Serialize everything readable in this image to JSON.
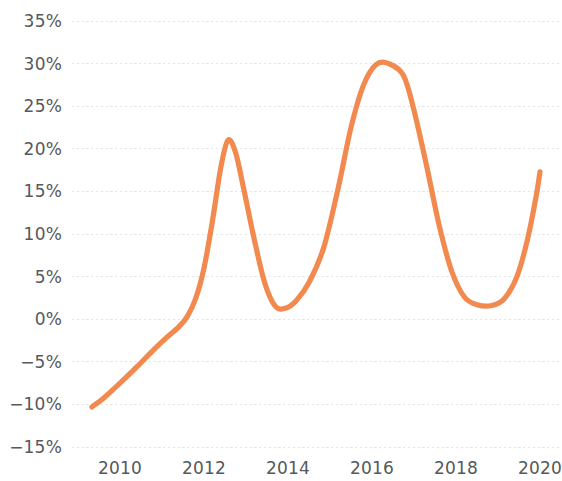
{
  "chart_data": {
    "type": "line",
    "title": "",
    "subtitle": "",
    "xlabel": "",
    "ylabel": "",
    "xlim": [
      2009.3,
      2020.0
    ],
    "ylim": [
      -15,
      35
    ],
    "grid": true,
    "legend_position": "none",
    "y_ticks": [
      "35%",
      "30%",
      "25%",
      "20%",
      "15%",
      "10%",
      "5%",
      "0%",
      "−5%",
      "−10%",
      "−15%"
    ],
    "y_tick_values": [
      35,
      30,
      25,
      20,
      15,
      10,
      5,
      0,
      -5,
      -10,
      -15
    ],
    "x_ticks": [
      "2010",
      "2012",
      "2014",
      "2016",
      "2018",
      "2020"
    ],
    "x_tick_values": [
      2010,
      2012,
      2014,
      2016,
      2018,
      2020
    ],
    "series": [
      {
        "name": "Series 1",
        "color": "#f2894f",
        "x": [
          2009.33,
          2009.6,
          2010.0,
          2010.4,
          2010.8,
          2011.1,
          2011.4,
          2011.6,
          2011.8,
          2012.0,
          2012.2,
          2012.4,
          2012.57,
          2012.75,
          2012.95,
          2013.2,
          2013.45,
          2013.7,
          2013.95,
          2014.2,
          2014.5,
          2014.85,
          2015.2,
          2015.5,
          2015.8,
          2016.1,
          2016.4,
          2016.75,
          2017.0,
          2017.3,
          2017.6,
          2017.9,
          2018.2,
          2018.5,
          2018.85,
          2019.15,
          2019.45,
          2019.7,
          2019.9,
          2020.0
        ],
        "y": [
          -10.3,
          -9.3,
          -7.5,
          -5.6,
          -3.6,
          -2.2,
          -0.9,
          0.3,
          2.4,
          6.0,
          11.5,
          17.8,
          21.0,
          19.6,
          15.2,
          9.3,
          4.2,
          1.5,
          1.3,
          2.2,
          4.3,
          8.4,
          15.5,
          22.5,
          27.5,
          29.9,
          30.0,
          28.6,
          24.5,
          18.0,
          11.0,
          5.6,
          2.6,
          1.7,
          1.6,
          2.4,
          5.0,
          9.3,
          14.2,
          17.3
        ]
      }
    ]
  },
  "axis": {
    "accent_color": "#f2894f",
    "gridline_color": "#e4e4e7",
    "tick_text_color": "#56585c",
    "background_color": "#ffffff"
  }
}
